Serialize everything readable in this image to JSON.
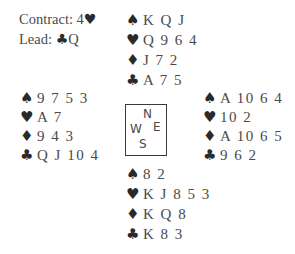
{
  "header": {
    "contract_label": "Contract:",
    "contract_level": "4",
    "contract_suit_icon": "♥",
    "lead_label": "Lead:",
    "lead_suit_icon": "♣",
    "lead_card": "Q"
  },
  "suit_icons": {
    "spades": "♠",
    "hearts": "♥",
    "diamonds": "♦",
    "clubs": "♣"
  },
  "hands": {
    "north": {
      "spades": "K Q J",
      "hearts": "Q 9 6 4",
      "diamonds": "J 7 2",
      "clubs": "A 7 5"
    },
    "west": {
      "spades": "9 7 5 3",
      "hearts": "A 7",
      "diamonds": "9 4 3",
      "clubs": "Q J 10 4"
    },
    "east": {
      "spades": "A 10 6 4",
      "hearts": "10 2",
      "diamonds": "A 10 6 5",
      "clubs": "9 6 2"
    },
    "south": {
      "spades": "8 2",
      "hearts": "K J 8 5 3",
      "diamonds": "K Q 8",
      "clubs": "K 8 3"
    }
  },
  "compass": {
    "n": "N",
    "s": "S",
    "e": "E",
    "w": "W"
  }
}
